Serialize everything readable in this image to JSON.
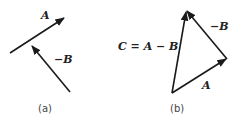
{
  "panel_a": {
    "vector_A_label": "A",
    "vector_negB_label": "−B",
    "caption": "(a)"
  },
  "panel_b": {
    "vector_C_label": "C = A − B",
    "vector_negB_label": "−B",
    "vector_A_label": "A",
    "caption": "(b)"
  },
  "colors": {
    "stroke": "#1a1a1a",
    "background": "#ffffff"
  }
}
